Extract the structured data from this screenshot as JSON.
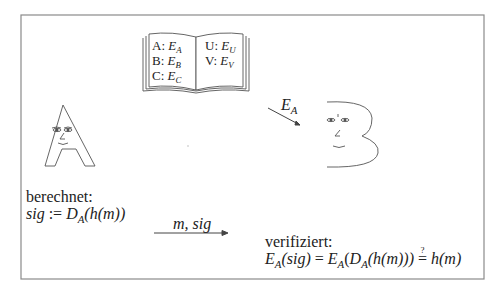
{
  "diagram": {
    "book": {
      "left_page": [
        {
          "name": "A",
          "key": "E",
          "key_sub": "A"
        },
        {
          "name": "B",
          "key": "E",
          "key_sub": "B"
        },
        {
          "name": "C",
          "key": "E",
          "key_sub": "C"
        }
      ],
      "right_page": [
        {
          "name": "U",
          "key": "E",
          "key_sub": "U"
        },
        {
          "name": "V",
          "key": "E",
          "key_sub": "V"
        }
      ]
    },
    "sender": {
      "label": "A",
      "step_label": "berechnet:",
      "formula": {
        "lhs": "sig",
        "op": ":=",
        "fn": "D",
        "fn_sub": "A",
        "arg": "(h(m))"
      }
    },
    "receiver": {
      "label": "B",
      "key_arrow_label": {
        "main": "E",
        "sub": "A"
      },
      "step_label": "verifiziert:",
      "formula": {
        "part1": "E",
        "part1_sub": "A",
        "part1_arg": "(sig)",
        "eq": "=",
        "part2": "E",
        "part2_sub": "A",
        "part2_open": "(",
        "part3": "D",
        "part3_sub": "A",
        "part3_arg": "(h(m)))",
        "qeq_symbol": "=",
        "qeq_mark": "?",
        "rhs": "h(m)"
      }
    },
    "message_arrow": {
      "label": "m, sig"
    },
    "colors": {
      "stroke": "#555555",
      "border": "#8a8a8a",
      "text": "#222222"
    }
  }
}
